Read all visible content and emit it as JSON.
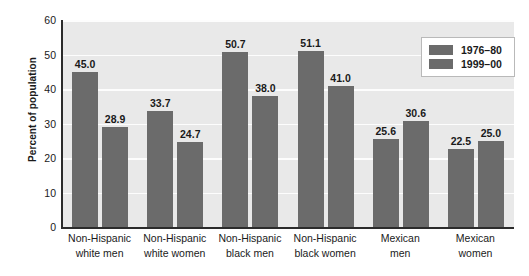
{
  "chart_data": {
    "type": "bar",
    "title": "",
    "subtitle": "",
    "xlabel": "",
    "ylabel": "Percent of population",
    "ylim": [
      0,
      60
    ],
    "yticks": [
      0,
      10,
      20,
      30,
      40,
      50,
      60
    ],
    "ytick_labels": [
      "0",
      "10",
      "20",
      "30",
      "40",
      "50",
      "60"
    ],
    "grid": "horizontal",
    "legend_position": "top-right",
    "categories": [
      "Non-Hispanic white men",
      "Non-Hispanic white women",
      "Non-Hispanic black men",
      "Non-Hispanic black women",
      "Mexican men",
      "Mexican women"
    ],
    "category_lines": [
      [
        "Non-Hispanic",
        "white men"
      ],
      [
        "Non-Hispanic",
        "white women"
      ],
      [
        "Non-Hispanic",
        "black men"
      ],
      [
        "Non-Hispanic",
        "black women"
      ],
      [
        "Mexican",
        "men"
      ],
      [
        "Mexican",
        "women"
      ]
    ],
    "series": [
      {
        "name": "1976–80",
        "color": "#6b6b6b",
        "values": [
          45.0,
          33.7,
          50.7,
          51.1,
          25.6,
          22.5
        ],
        "value_labels": [
          "45.0",
          "33.7",
          "50.7",
          "51.1",
          "25.6",
          "22.5"
        ]
      },
      {
        "name": "1999–00",
        "color": "#6b6b6b",
        "values": [
          28.9,
          24.7,
          38.0,
          41.0,
          30.6,
          25.0
        ],
        "value_labels": [
          "28.9",
          "24.7",
          "38.0",
          "41.0",
          "30.6",
          "25.0"
        ]
      }
    ],
    "legend": [
      {
        "label": "1976–80",
        "color": "#6b6b6b"
      },
      {
        "label": "1999–00",
        "color": "#6b6b6b"
      }
    ],
    "colors": {
      "bar": "#6b6b6b",
      "plot_background": "#e9e9e9",
      "gridline": "#fdfdfd",
      "axis": "#2b2b2b",
      "text": "#1a1a1a",
      "page_background": "#ffffff",
      "legend_background": "#ffffff",
      "legend_border": "#b9b9b9"
    }
  }
}
